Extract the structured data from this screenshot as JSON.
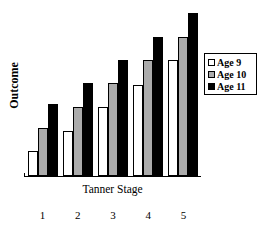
{
  "chart_data": {
    "type": "bar",
    "title": "",
    "xlabel": "Tanner Stage",
    "ylabel": "Outcome",
    "categories": [
      "1",
      "2",
      "3",
      "4",
      "5"
    ],
    "series": [
      {
        "name": "Age 9",
        "color": "#ffffff",
        "values": [
          26,
          46,
          71,
          94,
          119
        ]
      },
      {
        "name": "Age 10",
        "color": "#ababab",
        "values": [
          49,
          71,
          96,
          119,
          143
        ]
      },
      {
        "name": "Age 11",
        "color": "#000000",
        "values": [
          74,
          96,
          119,
          143,
          168
        ]
      }
    ],
    "ylim": [
      0,
      175
    ],
    "yticks": [],
    "grid": false,
    "legend_position": "right",
    "axis_style": "x-axis-only"
  },
  "axes": {
    "y_title": "Outcome",
    "x_title": "Tanner Stage",
    "x_tick_labels": [
      "1",
      "2",
      "3",
      "4",
      "5"
    ]
  },
  "legend": {
    "entries": [
      {
        "label": "Age 9",
        "swatch": "white-square-swatch"
      },
      {
        "label": "Age 10",
        "swatch": "gray-square-swatch"
      },
      {
        "label": "Age 11",
        "swatch": "black-square-swatch"
      }
    ]
  },
  "colors": {
    "age9": "#ffffff",
    "age10": "#ababab",
    "age11": "#000000",
    "outline": "#000000",
    "background": "#ffffff"
  }
}
